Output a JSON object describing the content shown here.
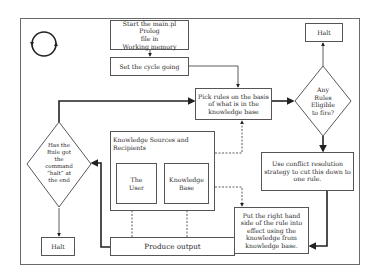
{
  "diagram": {
    "type": "flowchart",
    "cycle_icon": "circular-arrows-icon",
    "nodes": {
      "start": "Start the main.pl Prolog file in Working memory",
      "start_lines": [
        "Start the main.pl Prolog",
        "file in",
        "Working memory"
      ],
      "set_cycle": "Set the cycle going",
      "pick_rules_lines": [
        "Pick rules on the basis",
        "of what is in the",
        "knowledge base"
      ],
      "any_rules_lines": [
        "Any",
        "Rules",
        "Eligible",
        "to fire?"
      ],
      "halt_top": "Halt",
      "conflict_lines": [
        "Use conflict resolution",
        "strategy to cut this down to",
        "one rule."
      ],
      "put_rhs_lines": [
        "Put the right hand",
        "side of the rule into",
        "effect using the",
        "knowledge from",
        "knowledge base."
      ],
      "produce_output": "Produce output",
      "knowledge_sources_lines": [
        "Knowledge Sources and",
        "Recipients"
      ],
      "the_user_lines": [
        "The",
        "User"
      ],
      "knowledge_base_lines": [
        "Knowledge",
        "Base"
      ],
      "has_halt_lines": [
        "Has the",
        "Rule got",
        "the",
        "command",
        "“halt” at",
        "the end"
      ],
      "halt_bottom": "Halt"
    },
    "edges": [
      {
        "from": "start",
        "to": "set_cycle",
        "style": "solid"
      },
      {
        "from": "set_cycle",
        "to": "pick_rules",
        "style": "solid"
      },
      {
        "from": "pick_rules",
        "to": "any_rules",
        "style": "bold"
      },
      {
        "from": "any_rules",
        "to": "halt_top",
        "style": "solid",
        "label": "no"
      },
      {
        "from": "any_rules",
        "to": "conflict",
        "style": "bold"
      },
      {
        "from": "conflict",
        "to": "put_rhs",
        "style": "bold"
      },
      {
        "from": "put_rhs",
        "to": "produce_output",
        "style": "bold"
      },
      {
        "from": "produce_output",
        "to": "has_halt",
        "style": "bold"
      },
      {
        "from": "has_halt",
        "to": "halt_bottom",
        "style": "solid"
      },
      {
        "from": "has_halt",
        "to": "pick_rules",
        "style": "bold"
      },
      {
        "from": "produce_output",
        "to": "the_user",
        "style": "dashed"
      },
      {
        "from": "produce_output",
        "to": "knowledge_base",
        "style": "dashed"
      },
      {
        "from": "knowledge_sources",
        "to": "pick_rules",
        "style": "dashed"
      },
      {
        "from": "knowledge_base",
        "to": "put_rhs",
        "style": "dashed"
      }
    ]
  }
}
